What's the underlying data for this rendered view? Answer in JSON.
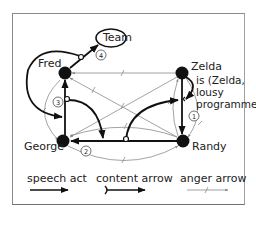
{
  "diagram": {
    "nodes": [
      {
        "id": "fred",
        "label": "Fred"
      },
      {
        "id": "zelda",
        "label": "Zelda"
      },
      {
        "id": "george",
        "label": "George"
      },
      {
        "id": "randy",
        "label": "Randy"
      },
      {
        "id": "team",
        "label": "Team"
      }
    ],
    "zelda_note": [
      "is (Zelda,",
      "lousy",
      "programmer)"
    ],
    "step_labels": [
      "①",
      "②",
      "③",
      "④"
    ],
    "legend": {
      "speech_act": "speech act",
      "content_arrow": "content arrow",
      "anger_arrow": "anger arrow"
    },
    "colors": {
      "speech": "#111111",
      "anger": "#888888",
      "node": "#111111",
      "frame": "#8a8a8a"
    }
  }
}
